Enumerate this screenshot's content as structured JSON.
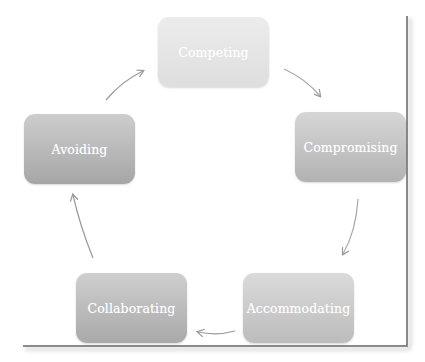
{
  "diagram": {
    "type": "cycle",
    "direction": "clockwise",
    "nodes": [
      {
        "id": "competing",
        "label": "Competing"
      },
      {
        "id": "compromising",
        "label": "Compromising"
      },
      {
        "id": "accommodating",
        "label": "Accommodating"
      },
      {
        "id": "collaborating",
        "label": "Collaborating"
      },
      {
        "id": "avoiding",
        "label": "Avoiding"
      }
    ],
    "edges": [
      {
        "from": "competing",
        "to": "compromising"
      },
      {
        "from": "compromising",
        "to": "accommodating"
      },
      {
        "from": "accommodating",
        "to": "collaborating"
      },
      {
        "from": "collaborating",
        "to": "avoiding"
      },
      {
        "from": "avoiding",
        "to": "competing"
      }
    ],
    "colors": {
      "competing": "#e4e4e4",
      "compromising": "#c4c4c4",
      "accommodating": "#cacaca",
      "collaborating": "#bcbcbc",
      "avoiding": "#b9b9b9",
      "arrow": "#9a9a9a",
      "label": "#ffffff"
    }
  }
}
